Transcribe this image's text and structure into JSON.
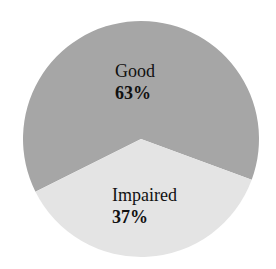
{
  "chart_data": {
    "type": "pie",
    "title": "",
    "categories": [
      "Good",
      "Impaired"
    ],
    "values": [
      63,
      37
    ],
    "unit": "%",
    "labels": [
      "Good 63%",
      "Impaired 37%"
    ],
    "colors": [
      "#a6a6a6",
      "#e4e4e4"
    ],
    "legend": "none (labels inside slices)"
  },
  "slices": [
    {
      "name": "Good",
      "percent": "63%",
      "color": "#a6a6a6"
    },
    {
      "name": "Impaired",
      "percent": "37%",
      "color": "#e4e4e4"
    }
  ]
}
